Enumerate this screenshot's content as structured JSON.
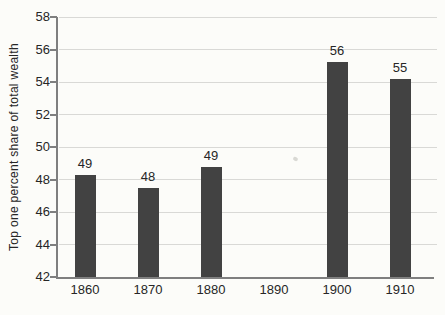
{
  "chart_data": {
    "type": "bar",
    "title": "",
    "xlabel": "",
    "ylabel": "Top one percent share of total wealth",
    "categories": [
      "1860",
      "1870",
      "1880",
      "1890",
      "1900",
      "1910"
    ],
    "values": [
      49,
      48,
      49,
      null,
      56,
      55
    ],
    "data_labels": [
      "49",
      "48",
      "49",
      "",
      "56",
      "55"
    ],
    "bar_render_values": [
      48.3,
      47.45,
      48.75,
      null,
      55.25,
      54.2
    ],
    "ylim": [
      42,
      58
    ],
    "yticks": [
      42,
      44,
      46,
      48,
      50,
      52,
      54,
      56,
      58
    ],
    "grid": "horizontal",
    "legend": "none",
    "colors": {
      "background": "#fcfcf9",
      "bar": "#424242",
      "grid": "#d9d9d6",
      "axis": "#7f7f7f",
      "text": "#262626",
      "artifact": "#cfcfcb"
    }
  }
}
